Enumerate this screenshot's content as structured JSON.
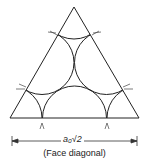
{
  "diagram": {
    "dimension_label": "a₀√2",
    "caption": "(Face diagonal)",
    "line_color": "#222222",
    "shape": "equilateral triangle with close-packed atoms on face of FCC unit cell"
  }
}
